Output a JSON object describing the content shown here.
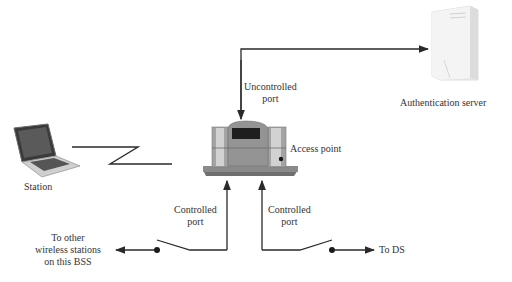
{
  "nodes": {
    "station": {
      "label": "Station"
    },
    "access_point": {
      "label": "Access point"
    },
    "auth_server": {
      "label": "Authentication server"
    },
    "other_stations": {
      "line1": "To other",
      "line2": "wireless stations",
      "line3": "on this BSS"
    },
    "ds": {
      "label": "To DS"
    }
  },
  "ports": {
    "uncontrolled": {
      "line1": "Uncontrolled",
      "line2": "port"
    },
    "controlled_left": {
      "line1": "Controlled",
      "line2": "port"
    },
    "controlled_right": {
      "line1": "Controlled",
      "line2": "port"
    }
  },
  "colors": {
    "line": "#2a2a2a",
    "ap_body": "#8e8e8e",
    "ap_base": "#6f6f6f",
    "server": "#e8e8e8"
  }
}
